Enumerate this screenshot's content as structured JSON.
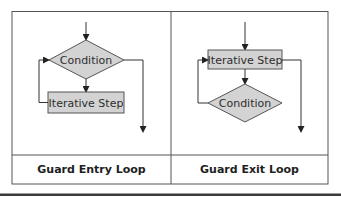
{
  "figure": {
    "panels": [
      {
        "caption": "Guard Entry Loop",
        "nodes": {
          "condition": "Condition",
          "step": "Iterative Step"
        }
      },
      {
        "caption": "Guard Exit Loop",
        "nodes": {
          "step": "Iterative Step",
          "condition": "Condition"
        }
      }
    ]
  },
  "colors": {
    "shape_fill": "#d3d3d3",
    "line": "#333333",
    "border": "#555555",
    "bottom_rule": "#3a3a3a"
  }
}
